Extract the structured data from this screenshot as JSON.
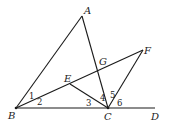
{
  "figure": {
    "points": {
      "A": {
        "label": "A",
        "x": 82,
        "y": 16
      },
      "B": {
        "label": "B",
        "x": 16,
        "y": 108
      },
      "C": {
        "label": "C",
        "x": 108,
        "y": 108
      },
      "D": {
        "label": "D",
        "x": 155,
        "y": 108
      },
      "E": {
        "label": "E",
        "x": 70,
        "y": 84
      },
      "F": {
        "label": "F",
        "x": 143,
        "y": 50
      },
      "G": {
        "label": "G",
        "x": 99,
        "y": 70
      }
    },
    "segments": [
      "AB",
      "AC",
      "BD",
      "BF",
      "EC",
      "CF"
    ],
    "angles": [
      {
        "label": "1",
        "vertex": "B",
        "between": "AB,BE"
      },
      {
        "label": "2",
        "vertex": "B",
        "between": "BE,BC"
      },
      {
        "label": "3",
        "vertex": "C",
        "between": "CB,CE"
      },
      {
        "label": "4",
        "vertex": "C",
        "between": "CE,CA"
      },
      {
        "label": "5",
        "vertex": "C",
        "between": "CA,CF"
      },
      {
        "label": "6",
        "vertex": "C",
        "between": "CF,CD"
      }
    ]
  }
}
